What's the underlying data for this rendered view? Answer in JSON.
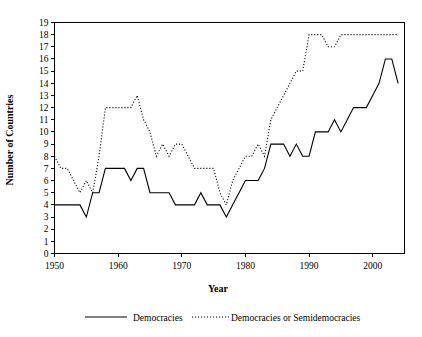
{
  "chart_data": {
    "type": "line",
    "title": "",
    "xlabel": "Year",
    "ylabel": "Number of Countries",
    "xlim": [
      1950,
      2005
    ],
    "ylim": [
      0,
      19
    ],
    "grid": false,
    "legend_position": "bottom",
    "x_ticks": [
      1950,
      1960,
      1970,
      1980,
      1990,
      2000
    ],
    "x_tick_labels": [
      "1950",
      "1960",
      "1970",
      "1980",
      "1990",
      "2000"
    ],
    "y_ticks": [
      0,
      1,
      2,
      3,
      4,
      5,
      6,
      7,
      8,
      9,
      10,
      11,
      12,
      13,
      14,
      15,
      16,
      17,
      18,
      19
    ],
    "y_tick_labels": [
      "0",
      "1",
      "2",
      "3",
      "4",
      "5",
      "6",
      "7",
      "8",
      "9",
      "10",
      "11",
      "12",
      "13",
      "14",
      "15",
      "16",
      "17",
      "18",
      "19"
    ],
    "x": [
      1950,
      1951,
      1952,
      1953,
      1954,
      1955,
      1956,
      1957,
      1958,
      1959,
      1960,
      1961,
      1962,
      1963,
      1964,
      1965,
      1966,
      1967,
      1968,
      1969,
      1970,
      1971,
      1972,
      1973,
      1974,
      1975,
      1976,
      1977,
      1978,
      1979,
      1980,
      1981,
      1982,
      1983,
      1984,
      1985,
      1986,
      1987,
      1988,
      1989,
      1990,
      1991,
      1992,
      1993,
      1994,
      1995,
      1996,
      1997,
      1998,
      1999,
      2000,
      2001,
      2002,
      2003,
      2004
    ],
    "series": [
      {
        "name": "Democracies",
        "style": "solid",
        "color": "#000000",
        "values": [
          4,
          4,
          4,
          4,
          4,
          3,
          5,
          5,
          7,
          7,
          7,
          7,
          6,
          7,
          7,
          5,
          5,
          5,
          5,
          4,
          4,
          4,
          4,
          5,
          4,
          4,
          4,
          3,
          4,
          5,
          6,
          6,
          6,
          7,
          9,
          9,
          9,
          8,
          9,
          8,
          8,
          10,
          10,
          10,
          11,
          10,
          11,
          12,
          12,
          12,
          13,
          14,
          16,
          16,
          14
        ]
      },
      {
        "name": "Democracies or Semidemocracies",
        "style": "dotted",
        "color": "#000000",
        "values": [
          8,
          7,
          7,
          6,
          5,
          6,
          5,
          8,
          12,
          12,
          12,
          12,
          12,
          13,
          11,
          10,
          8,
          9,
          8,
          9,
          9,
          8,
          7,
          7,
          7,
          7,
          5,
          4,
          6,
          7,
          8,
          8,
          9,
          8,
          11,
          12,
          13,
          14,
          15,
          15,
          18,
          18,
          18,
          17,
          17,
          18,
          18,
          18,
          18,
          18,
          18,
          18,
          18,
          18,
          18
        ]
      }
    ]
  },
  "legend": {
    "items": [
      {
        "label": "Democracies",
        "style": "solid"
      },
      {
        "label": "Democracies or Semidemocracies",
        "style": "dotted"
      }
    ]
  }
}
